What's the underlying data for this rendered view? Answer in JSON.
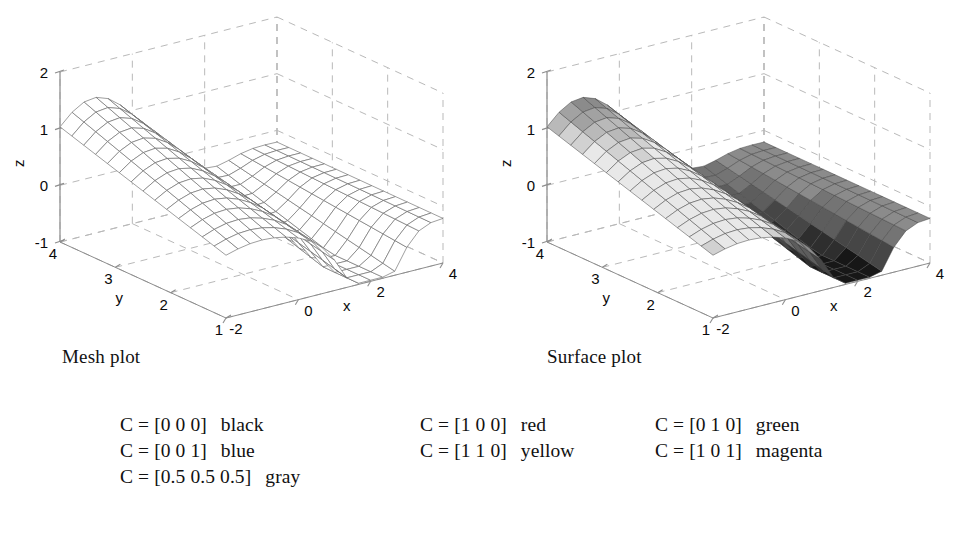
{
  "figure": {
    "background": "#ffffff",
    "ink": "#111111"
  },
  "plots": [
    {
      "id": "mesh",
      "caption": "Mesh plot",
      "style": "wireframe",
      "axes": {
        "z": {
          "name": "z",
          "ticks": [
            "2",
            "1",
            "0",
            "-1"
          ],
          "values": [
            2,
            1,
            0,
            -1
          ],
          "range": [
            -1,
            2
          ]
        },
        "y": {
          "name": "y",
          "ticks": [
            "4",
            "3",
            "2",
            "1"
          ],
          "values": [
            4,
            3,
            2,
            1
          ],
          "range": [
            1,
            4
          ]
        },
        "x": {
          "name": "x",
          "ticks": [
            "-2",
            "0",
            "2",
            "4"
          ],
          "values": [
            -2,
            0,
            2,
            4
          ],
          "range": [
            -2,
            4
          ]
        }
      }
    },
    {
      "id": "surface",
      "caption": "Surface plot",
      "style": "shaded",
      "axes": {
        "z": {
          "name": "z",
          "ticks": [
            "2",
            "1",
            "0",
            "-1"
          ],
          "values": [
            2,
            1,
            0,
            -1
          ],
          "range": [
            -1,
            2
          ]
        },
        "y": {
          "name": "y",
          "ticks": [
            "4",
            "3",
            "2",
            "1"
          ],
          "values": [
            4,
            3,
            2,
            1
          ],
          "range": [
            1,
            4
          ]
        },
        "x": {
          "name": "x",
          "ticks": [
            "-2",
            "0",
            "2",
            "4"
          ],
          "values": [
            -2,
            0,
            2,
            4
          ],
          "range": [
            -2,
            4
          ]
        }
      }
    }
  ],
  "chart_data": {
    "type": "surface",
    "title": "",
    "plots": [
      {
        "name": "Mesh plot",
        "render": "mesh",
        "colormap": "none",
        "edgecolor": "#555555",
        "facecolor": "none"
      },
      {
        "name": "Surface plot",
        "render": "surf",
        "colormap": "gray",
        "edgecolor": "#3a3a3a"
      }
    ],
    "xlabel": "x",
    "ylabel": "y",
    "zlabel": "z",
    "xlim": [
      -2,
      4
    ],
    "ylim": [
      1,
      4
    ],
    "zlim": [
      -1,
      2
    ],
    "xticks": [
      -2,
      0,
      2,
      4
    ],
    "yticks": [
      1,
      2,
      3,
      4
    ],
    "zticks": [
      -1,
      0,
      1,
      2
    ],
    "grid": true,
    "grid_style": "dashed",
    "view": {
      "azimuth": -37.5,
      "elevation": 30
    },
    "surface_note": "Smooth single-peak sheet: high ridge at small x / large y falling to a trough near x=2, flattening toward x=4",
    "z_shading": "gray colormap mapped to z: dark at z-min and z-max extremes of the band sequence, light in the middle",
    "mesh_divisions": {
      "x": 18,
      "y": 14
    }
  },
  "legend": {
    "rows": [
      {
        "col": 0,
        "row": 0,
        "code": "C = [0 0 0]",
        "name": "black",
        "hex": "#000000"
      },
      {
        "col": 0,
        "row": 1,
        "code": "C = [0 0 1]",
        "name": "blue",
        "hex": "#0000ff"
      },
      {
        "col": 0,
        "row": 2,
        "code": "C = [0.5 0.5 0.5]",
        "name": "gray",
        "hex": "#808080"
      },
      {
        "col": 1,
        "row": 0,
        "code": "C = [1 0 0]",
        "name": "red",
        "hex": "#ff0000"
      },
      {
        "col": 1,
        "row": 1,
        "code": "C = [1 1 0]",
        "name": "yellow",
        "hex": "#ffff00"
      },
      {
        "col": 2,
        "row": 0,
        "code": "C = [0 1 0]",
        "name": "green",
        "hex": "#00ff00"
      },
      {
        "col": 2,
        "row": 1,
        "code": "C = [1 0 1]",
        "name": "magenta",
        "hex": "#ff00ff"
      }
    ]
  }
}
